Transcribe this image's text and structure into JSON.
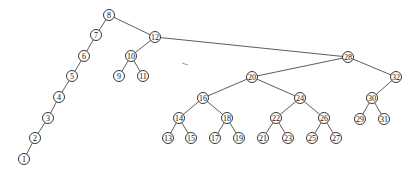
{
  "diagram": {
    "type": "binary-search-tree",
    "node_radius": 5.5,
    "nodes": [
      {
        "id": "8",
        "label": "8",
        "x": 109,
        "y": 15
      },
      {
        "id": "7",
        "label": "7",
        "x": 96,
        "y": 35
      },
      {
        "id": "6",
        "label": "6",
        "x": 84,
        "y": 56
      },
      {
        "id": "5",
        "label": "5",
        "x": 72,
        "y": 76
      },
      {
        "id": "4",
        "label": "4",
        "x": 59,
        "y": 97
      },
      {
        "id": "3",
        "label": "3",
        "x": 48,
        "y": 118
      },
      {
        "id": "2",
        "label": "2",
        "x": 35,
        "y": 138
      },
      {
        "id": "1",
        "label": "1",
        "x": 24,
        "y": 159
      },
      {
        "id": "12",
        "label": "12",
        "x": 155,
        "y": 37
      },
      {
        "id": "10",
        "label": "10",
        "x": 131,
        "y": 56
      },
      {
        "id": "9",
        "label": "9",
        "x": 119,
        "y": 76
      },
      {
        "id": "11",
        "label": "11",
        "x": 143,
        "y": 76
      },
      {
        "id": "28",
        "label": "28",
        "x": 348,
        "y": 57
      },
      {
        "id": "20",
        "label": "20",
        "x": 252,
        "y": 77
      },
      {
        "id": "32",
        "label": "32",
        "x": 396,
        "y": 77
      },
      {
        "id": "16",
        "label": "16",
        "x": 203,
        "y": 98
      },
      {
        "id": "24",
        "label": "24",
        "x": 300,
        "y": 98
      },
      {
        "id": "30",
        "label": "30",
        "x": 372,
        "y": 98
      },
      {
        "id": "14",
        "label": "14",
        "x": 179,
        "y": 118
      },
      {
        "id": "18",
        "label": "18",
        "x": 227,
        "y": 118
      },
      {
        "id": "22",
        "label": "22",
        "x": 276,
        "y": 118
      },
      {
        "id": "26",
        "label": "26",
        "x": 324,
        "y": 118
      },
      {
        "id": "29",
        "label": "29",
        "x": 360,
        "y": 119
      },
      {
        "id": "31",
        "label": "31",
        "x": 384,
        "y": 119
      },
      {
        "id": "13",
        "label": "13",
        "x": 168,
        "y": 138
      },
      {
        "id": "15",
        "label": "15",
        "x": 191,
        "y": 138
      },
      {
        "id": "17",
        "label": "17",
        "x": 215,
        "y": 138
      },
      {
        "id": "19",
        "label": "19",
        "x": 239,
        "y": 138
      },
      {
        "id": "21",
        "label": "21",
        "x": 263,
        "y": 138
      },
      {
        "id": "23",
        "label": "23",
        "x": 288,
        "y": 138
      },
      {
        "id": "25",
        "label": "25",
        "x": 312,
        "y": 138
      },
      {
        "id": "27",
        "label": "27",
        "x": 336,
        "y": 138
      }
    ],
    "edges": [
      [
        "8",
        "7"
      ],
      [
        "7",
        "6"
      ],
      [
        "6",
        "5"
      ],
      [
        "5",
        "4"
      ],
      [
        "4",
        "3"
      ],
      [
        "3",
        "2"
      ],
      [
        "2",
        "1"
      ],
      [
        "8",
        "12"
      ],
      [
        "12",
        "10"
      ],
      [
        "10",
        "9"
      ],
      [
        "10",
        "11"
      ],
      [
        "12",
        "28"
      ],
      [
        "28",
        "20"
      ],
      [
        "28",
        "32"
      ],
      [
        "20",
        "16"
      ],
      [
        "20",
        "24"
      ],
      [
        "32",
        "30"
      ],
      [
        "16",
        "14"
      ],
      [
        "16",
        "18"
      ],
      [
        "24",
        "22"
      ],
      [
        "24",
        "26"
      ],
      [
        "30",
        "29"
      ],
      [
        "30",
        "31"
      ],
      [
        "14",
        "13"
      ],
      [
        "14",
        "15"
      ],
      [
        "18",
        "17"
      ],
      [
        "18",
        "19"
      ],
      [
        "22",
        "21"
      ],
      [
        "22",
        "23"
      ],
      [
        "26",
        "25"
      ],
      [
        "26",
        "27"
      ]
    ]
  }
}
